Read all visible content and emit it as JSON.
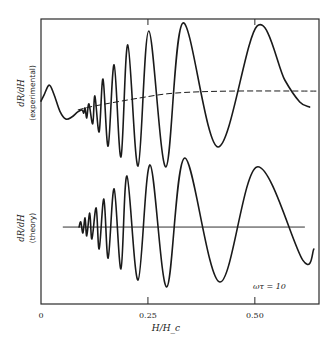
{
  "chart_data": {
    "type": "line",
    "title": "",
    "xlabel": "H/H_c",
    "ylabel_top": "dR/dH",
    "ylabel_top_sub": "(experimental)",
    "ylabel_bottom": "dR/dH",
    "ylabel_bottom_sub": "(theory)",
    "xlim": [
      0,
      0.65
    ],
    "ylim": [
      0,
      100
    ],
    "x_ticks": [
      0,
      0.25,
      0.5
    ],
    "x_tick_labels": [
      "0",
      "0.25",
      "0.50"
    ],
    "grid": false,
    "annotation": "ωτ = 10",
    "series": [
      {
        "name": "experimental",
        "style": "solid",
        "points": [
          [
            0.0,
            71.2
          ],
          [
            0.007,
            73.3
          ],
          [
            0.019,
            76.8
          ],
          [
            0.03,
            73.7
          ],
          [
            0.044,
            67.7
          ],
          [
            0.058,
            64.9
          ],
          [
            0.072,
            65.6
          ],
          [
            0.086,
            67.4
          ],
          [
            0.096,
            68.1
          ],
          [
            0.1,
            67.0
          ],
          [
            0.103,
            68.8
          ],
          [
            0.107,
            65.3
          ],
          [
            0.112,
            70.2
          ],
          [
            0.121,
            63.2
          ],
          [
            0.126,
            73.0
          ],
          [
            0.136,
            60.4
          ],
          [
            0.145,
            78.9
          ],
          [
            0.157,
            55.4
          ],
          [
            0.171,
            83.9
          ],
          [
            0.187,
            51.6
          ],
          [
            0.203,
            90.9
          ],
          [
            0.227,
            48.4
          ],
          [
            0.252,
            95.8
          ],
          [
            0.292,
            48.1
          ],
          [
            0.332,
            98.6
          ],
          [
            0.414,
            55.1
          ],
          [
            0.505,
            97.5
          ],
          [
            0.57,
            78.6
          ],
          [
            0.605,
            70.9
          ],
          [
            0.628,
            69.1
          ]
        ]
      },
      {
        "name": "experimental-background",
        "style": "dashed",
        "points": [
          [
            0.086,
            68.1
          ],
          [
            0.126,
            69.5
          ],
          [
            0.231,
            72.3
          ],
          [
            0.313,
            74.0
          ],
          [
            0.442,
            74.7
          ],
          [
            0.647,
            74.7
          ]
        ]
      },
      {
        "name": "theory",
        "style": "solid",
        "points": [
          [
            0.089,
            27.0
          ],
          [
            0.093,
            28.8
          ],
          [
            0.098,
            24.9
          ],
          [
            0.103,
            30.2
          ],
          [
            0.107,
            23.9
          ],
          [
            0.114,
            31.9
          ],
          [
            0.119,
            22.8
          ],
          [
            0.129,
            33.7
          ],
          [
            0.136,
            19.3
          ],
          [
            0.147,
            36.8
          ],
          [
            0.157,
            16.1
          ],
          [
            0.171,
            40.4
          ],
          [
            0.187,
            12.3
          ],
          [
            0.201,
            44.9
          ],
          [
            0.227,
            8.4
          ],
          [
            0.255,
            48.8
          ],
          [
            0.294,
            6.0
          ],
          [
            0.336,
            51.2
          ],
          [
            0.418,
            7.7
          ],
          [
            0.505,
            48.1
          ],
          [
            0.612,
            15.4
          ],
          [
            0.638,
            19.3
          ]
        ]
      },
      {
        "name": "theory-baseline",
        "style": "solid-thin",
        "points": [
          [
            0.051,
            27.0
          ],
          [
            0.617,
            27.0
          ]
        ]
      }
    ]
  }
}
